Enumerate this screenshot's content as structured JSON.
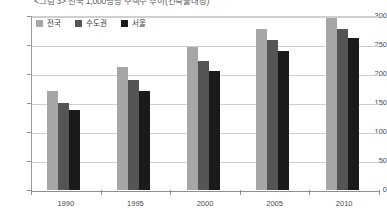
{
  "chart_data": {
    "type": "bar",
    "title": "<그림 3> 전국 1,000명당 주택수 추이(건축물대장)",
    "xlabel": "",
    "ylabel": "",
    "categories": [
      "1990",
      "1995",
      "2000",
      "2005",
      "2010"
    ],
    "series": [
      {
        "name": "전국",
        "color": "#a6a6a6",
        "values": [
          170,
          212,
          247,
          277,
          296
        ]
      },
      {
        "name": "수도권",
        "color": "#555555",
        "values": [
          150,
          190,
          222,
          258,
          277
        ]
      },
      {
        "name": "서울",
        "color": "#1a1a1a",
        "values": [
          138,
          170,
          205,
          240,
          262
        ]
      }
    ],
    "ylim": [
      0,
      300
    ],
    "yticks": [
      0,
      50,
      100,
      150,
      200,
      250,
      300
    ],
    "ytick_labels": [
      "0",
      "50",
      "100",
      "150",
      "200",
      "250",
      "300"
    ],
    "grid": true,
    "legend_position": "top-left"
  },
  "legend": {
    "items": [
      {
        "label": "전국"
      },
      {
        "label": "수도권"
      },
      {
        "label": "서울"
      }
    ]
  }
}
